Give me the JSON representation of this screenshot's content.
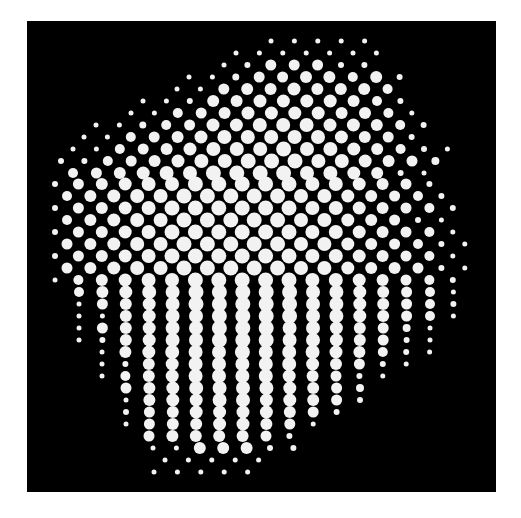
{
  "image": {
    "subject": "halftone dot pattern forming an irregular blob",
    "background_color": "#ffffff",
    "panel_color": "#000000",
    "dot_color": "#f2f2f2",
    "panel": {
      "x": 27,
      "y": 21,
      "width": 469,
      "height": 471
    }
  },
  "grid": {
    "pitch_x": 23.4,
    "rows": [
      {
        "y": 41,
        "x0": 271,
        "r": [
          2.5,
          2.5,
          2.5,
          2.5,
          2.5
        ]
      },
      {
        "y": 53,
        "x0": 236,
        "r": [
          2.5,
          2.5,
          2.5,
          2.5,
          2.5,
          2.5,
          2.5
        ]
      },
      {
        "y": 65,
        "x0": 224,
        "r": [
          2.5,
          3,
          5.5,
          5.5,
          5.5,
          3,
          3
        ]
      },
      {
        "y": 77,
        "x0": 189,
        "r": [
          2.5,
          2.5,
          3.5,
          5.5,
          5.5,
          6,
          6,
          5,
          6,
          3
        ]
      },
      {
        "y": 89,
        "x0": 177,
        "r": [
          2.5,
          2.5,
          5.5,
          6,
          6,
          6.5,
          6,
          6,
          6,
          5
        ]
      },
      {
        "y": 101,
        "x0": 143,
        "r": [
          2.5,
          2.5,
          3,
          6,
          6,
          6.5,
          6.5,
          6.5,
          6.5,
          6,
          5,
          3
        ]
      },
      {
        "y": 113,
        "x0": 131,
        "r": [
          2.5,
          2.5,
          5,
          5.5,
          6,
          6.5,
          6.5,
          6.5,
          6.5,
          6,
          6,
          5,
          2.5
        ]
      },
      {
        "y": 125,
        "x0": 96,
        "r": [
          2.5,
          2.5,
          3.5,
          5,
          5.5,
          6.5,
          6.5,
          7,
          7,
          7,
          6.5,
          6.5,
          6,
          5,
          3
        ]
      },
      {
        "y": 137,
        "x0": 84,
        "r": [
          2.5,
          2.5,
          5,
          5.5,
          6,
          6.5,
          7,
          7,
          7,
          7,
          7,
          6.5,
          6,
          5.5,
          3
        ]
      },
      {
        "y": 149,
        "x0": 73,
        "r": [
          2.5,
          2.5,
          5,
          5.5,
          6,
          6.5,
          7,
          7,
          7,
          7.5,
          7,
          7,
          6.5,
          6,
          5,
          3,
          2.5
        ]
      },
      {
        "y": 161,
        "x0": 61,
        "r": [
          3,
          3,
          5,
          5.5,
          6,
          6.5,
          7,
          7,
          7.5,
          7.5,
          7.5,
          7,
          7,
          6.5,
          6,
          5.5,
          4
        ]
      },
      {
        "y": 173,
        "x0": 73,
        "r": [
          5,
          5.5,
          6,
          6.5,
          7,
          7,
          7.5,
          7.5,
          7.5,
          7.5,
          7,
          7,
          6.5,
          6,
          3,
          2.5
        ]
      },
      {
        "y": 184,
        "x0": 55,
        "r": [
          3,
          5.5,
          6,
          6.5,
          7,
          7,
          7.5,
          7.5,
          7.5,
          7.5,
          7.5,
          7,
          7,
          6.5,
          6,
          5.5,
          3
        ]
      },
      {
        "y": 196,
        "x0": 67,
        "r": [
          5,
          6,
          6.5,
          7,
          7,
          7.5,
          7.5,
          7.5,
          7.5,
          7.5,
          7,
          7,
          6.5,
          6,
          5.5,
          5,
          3
        ]
      },
      {
        "y": 208,
        "x0": 55,
        "r": [
          3,
          5.5,
          6,
          6.5,
          7,
          7.5,
          7.5,
          7.5,
          7.5,
          7.5,
          7.5,
          7,
          7,
          6.5,
          6,
          5.5,
          5,
          3
        ]
      },
      {
        "y": 220,
        "x0": 67,
        "r": [
          5,
          6,
          6.5,
          7,
          7,
          7.5,
          7.5,
          7.5,
          7.5,
          7.5,
          7,
          7,
          6.5,
          6,
          5.5,
          3,
          2.5
        ]
      },
      {
        "y": 232,
        "x0": 55,
        "r": [
          3,
          5.5,
          6,
          6.5,
          7,
          7.5,
          7.5,
          7.5,
          7.5,
          7.5,
          7.5,
          7,
          7,
          6.5,
          6,
          5.5,
          5,
          2.5
        ]
      },
      {
        "y": 244,
        "x0": 67,
        "r": [
          5.5,
          6,
          6.5,
          7,
          7,
          7.5,
          7.5,
          7.5,
          7.5,
          7.5,
          7,
          7,
          6.5,
          6,
          5.5,
          5,
          3,
          2.5
        ]
      },
      {
        "y": 256,
        "x0": 55,
        "r": [
          3,
          5.5,
          6,
          6.5,
          7,
          7.5,
          7.5,
          7.5,
          7.5,
          7.5,
          7.5,
          7,
          7,
          6.5,
          6,
          5.5,
          5,
          2.5
        ]
      },
      {
        "y": 268,
        "x0": 67,
        "r": [
          5.5,
          6,
          6.5,
          7,
          7,
          7.5,
          7.5,
          7.5,
          7.5,
          7.5,
          7,
          7,
          6.5,
          6,
          6,
          5.5,
          3,
          2.5
        ]
      },
      {
        "y": 280,
        "x0": 55,
        "r": [
          2.5,
          5,
          6,
          6.5,
          7,
          7,
          7.5,
          7.5,
          7.5,
          7.5,
          7.5,
          7,
          7,
          6.5,
          6,
          5.5,
          5,
          3
        ]
      },
      {
        "y": 292,
        "x0": 79,
        "r": [
          5,
          6,
          6.5,
          7,
          7,
          7.5,
          7.5,
          7.5,
          7.5,
          7.5,
          7,
          7,
          6.5,
          6,
          5.5,
          5,
          2.5
        ]
      },
      {
        "y": 304,
        "x0": 79,
        "r": [
          2.5,
          5.5,
          6,
          6.5,
          7,
          7.5,
          7.5,
          7.5,
          7.5,
          7.5,
          7,
          7,
          6.5,
          6,
          5.5,
          5,
          3
        ]
      },
      {
        "y": 316,
        "x0": 79,
        "r": [
          2.5,
          2.5,
          6,
          6.5,
          7,
          7,
          7.5,
          7.5,
          7.5,
          7.5,
          7,
          7,
          6.5,
          6,
          5.5,
          5,
          2.5
        ]
      },
      {
        "y": 328,
        "x0": 79,
        "r": [
          2.5,
          5.5,
          6,
          6.5,
          7,
          7,
          7.5,
          7.5,
          7.5,
          7,
          7,
          6.5,
          6,
          5.5,
          4,
          2.5
        ]
      },
      {
        "y": 340,
        "x0": 79,
        "r": [
          2.5,
          3,
          6,
          6.5,
          7,
          7,
          7.5,
          7.5,
          7.5,
          7,
          7,
          6.5,
          6,
          5.5,
          3,
          2.5
        ]
      },
      {
        "y": 352,
        "x0": 102,
        "r": [
          2.5,
          6,
          6.5,
          7,
          7,
          7,
          7.5,
          7,
          7,
          7,
          6.5,
          6,
          5,
          3,
          2.5
        ]
      },
      {
        "y": 364,
        "x0": 102,
        "r": [
          2.5,
          3,
          6,
          6.5,
          7,
          7,
          7,
          7,
          7,
          6.5,
          6,
          5.5,
          3,
          2.5
        ]
      },
      {
        "y": 376,
        "x0": 102,
        "r": [
          2.5,
          5,
          6,
          6.5,
          7,
          7,
          7,
          7,
          6.5,
          6,
          5.5,
          3,
          2.5
        ]
      },
      {
        "y": 388,
        "x0": 126,
        "r": [
          5.5,
          6,
          6.5,
          7,
          7,
          7,
          7,
          6.5,
          6,
          5.5,
          4
        ]
      },
      {
        "y": 400,
        "x0": 126,
        "r": [
          2.5,
          6,
          6.5,
          6.5,
          7,
          7,
          6.5,
          6.5,
          6,
          5.5,
          3
        ]
      },
      {
        "y": 412,
        "x0": 126,
        "r": [
          3,
          5.5,
          6,
          6.5,
          6.5,
          6.5,
          6.5,
          6,
          5.5,
          3
        ]
      },
      {
        "y": 424,
        "x0": 126,
        "r": [
          2.5,
          5.5,
          6,
          6,
          6.5,
          6.5,
          6,
          5.5,
          2.5
        ]
      },
      {
        "y": 436,
        "x0": 149,
        "r": [
          5.5,
          6,
          6,
          6,
          6,
          5.5,
          3
        ]
      },
      {
        "y": 448,
        "x0": 153,
        "r": [
          2.5,
          2.5,
          6,
          6,
          6,
          3,
          3
        ]
      },
      {
        "y": 460,
        "x0": 165,
        "r": [
          2.5,
          2.5,
          2.5,
          2.5,
          2.5
        ]
      },
      {
        "y": 472,
        "x0": 154,
        "r": [
          2.5,
          2.5,
          2.5,
          2.5,
          2.5
        ]
      }
    ]
  }
}
